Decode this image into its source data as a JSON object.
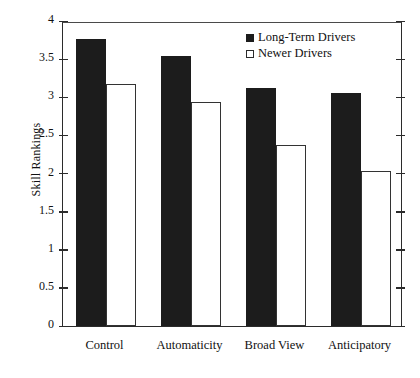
{
  "chart_data": {
    "type": "bar",
    "title": "",
    "xlabel": "",
    "ylabel": "Skill Rankings",
    "categories": [
      "Control",
      "Automaticity",
      "Broad View",
      "Anticipatory"
    ],
    "series": [
      {
        "name": "Long-Term Drivers",
        "swatch": "filled",
        "color": "#1c1c1c",
        "values": [
          3.77,
          3.54,
          3.12,
          3.06
        ]
      },
      {
        "name": "Newer Drivers",
        "swatch": "open",
        "color": "#ffffff",
        "values": [
          3.17,
          2.94,
          2.37,
          2.03
        ]
      }
    ],
    "ylim": [
      0,
      4
    ],
    "ytick_labels": [
      "0",
      "0.5",
      "1",
      "1.5",
      "2",
      "2.5",
      "3",
      "3.5",
      "4"
    ],
    "ytick_values": [
      0,
      0.5,
      1,
      1.5,
      2,
      2.5,
      3,
      3.5,
      4
    ],
    "grid": false,
    "legend_position": "top-center"
  },
  "legend": {
    "items": [
      {
        "label": "Long-Term Drivers",
        "swatch": "filled"
      },
      {
        "label": "Newer Drivers",
        "swatch": "open"
      }
    ]
  }
}
